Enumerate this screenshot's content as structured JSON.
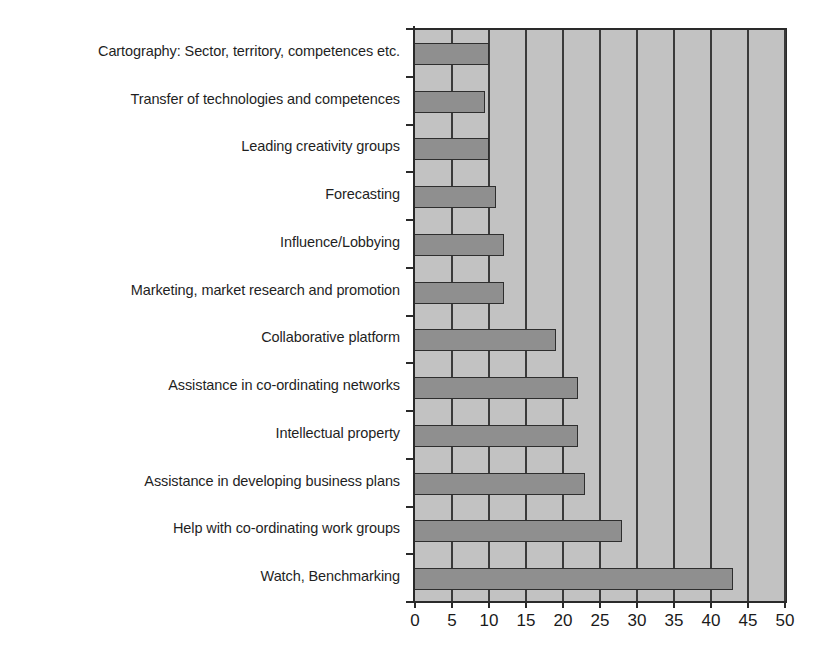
{
  "chart_data": {
    "type": "bar",
    "orientation": "horizontal",
    "title": "",
    "subtitle": "",
    "xlabel": "",
    "ylabel": "",
    "xlim": [
      0,
      50
    ],
    "xticks": [
      "0",
      "5",
      "10",
      "15",
      "20",
      "25",
      "30",
      "35",
      "40",
      "45",
      "50"
    ],
    "xtick_values": [
      0,
      5,
      10,
      15,
      20,
      25,
      30,
      35,
      40,
      45,
      50
    ],
    "grid": true,
    "legend": false,
    "legend_position": "none",
    "categories": [
      "Cartography: Sector, territory, competences etc.",
      "Transfer of technologies and competences",
      "Leading creativity groups",
      "Forecasting",
      "Influence/Lobbying",
      "Marketing, market research and promotion",
      "Collaborative platform",
      "Assistance in co-ordinating networks",
      "Intellectual property",
      "Assistance in developing business plans",
      "Help with co-ordinating work groups",
      "Watch, Benchmarking"
    ],
    "values": [
      10,
      9.5,
      10,
      11,
      12,
      12,
      19,
      22,
      22,
      23,
      28,
      43
    ],
    "colors": {
      "bar_fill": "#8f8f8f",
      "bar_stroke": "#2e2e2e",
      "plot_background": "#c2c2c2",
      "gridline": "#3a3a3a",
      "axis": "#2a2a2a",
      "text": "#1a1a1a",
      "page_background": "#ffffff"
    }
  }
}
